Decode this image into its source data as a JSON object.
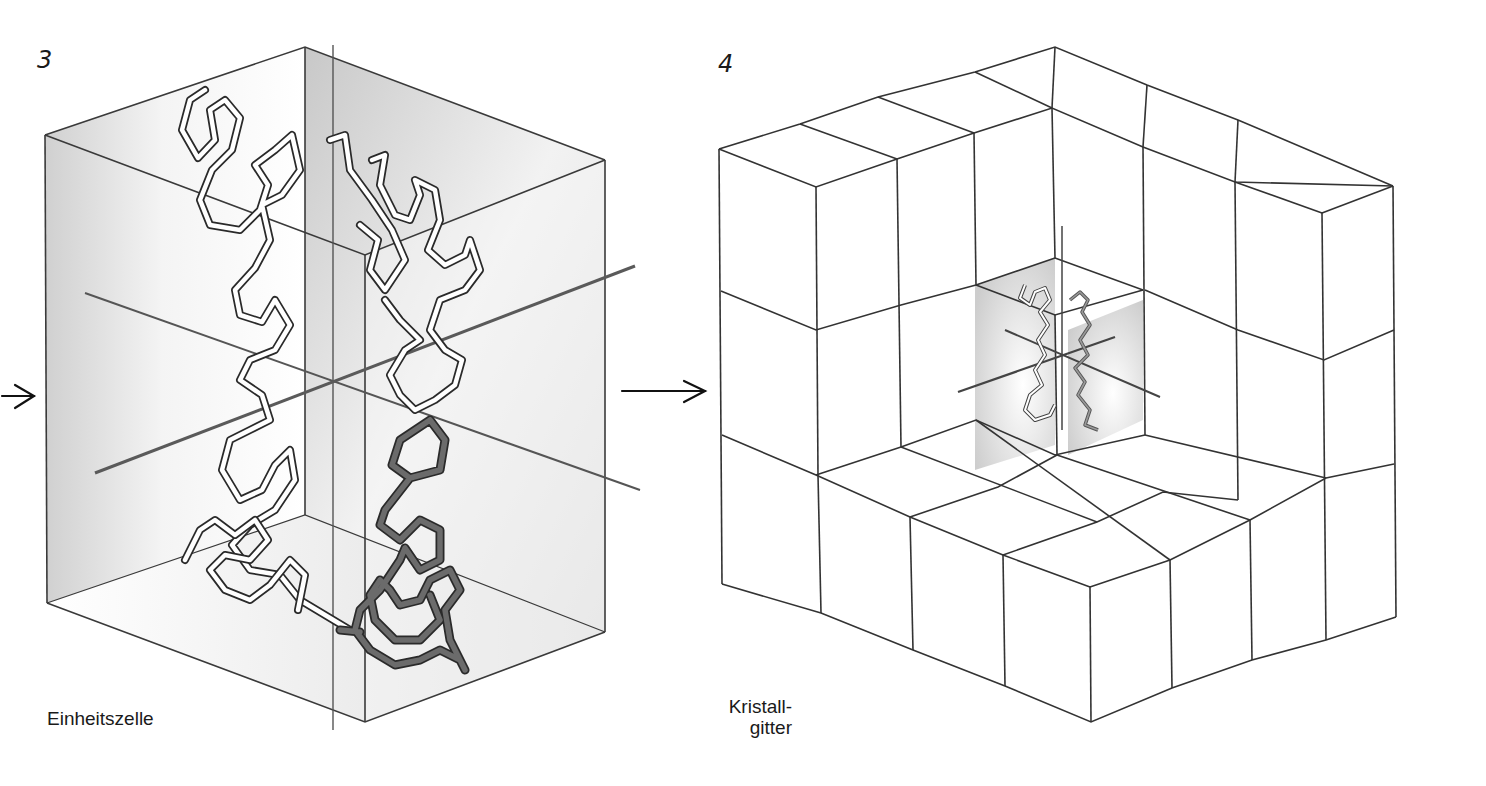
{
  "figures": [
    {
      "number": "3",
      "caption": "Einheitszelle",
      "description": "Unit cell box containing protein backbone chains with axis lines"
    },
    {
      "number": "4",
      "caption_line1": "Kristall-",
      "caption_line2": "gitter",
      "description": "Crystal lattice of stacked unit cells with highlighted cell containing protein"
    }
  ],
  "arrows": [
    {
      "name": "incoming-arrow",
      "glyph": "→"
    },
    {
      "name": "transition-arrow",
      "glyph": "→"
    }
  ],
  "colors": {
    "line": "#3a3a3a",
    "shade": "#cfcfcf",
    "chain_light": "#ffffff",
    "chain_dark": "#6b6b6b",
    "axis": "#555555"
  }
}
